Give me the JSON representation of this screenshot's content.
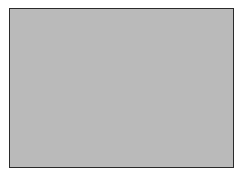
{
  "image": {
    "kind": "noise-texture",
    "description": "Framed rectangular panel filled with fine-grained monochrome random noise (white-noise static)",
    "background_color": "#ffffff",
    "panel": {
      "border_color": "#2a2a2a",
      "border_width_px": 1,
      "left_px": 9,
      "top_px": 8,
      "width_px": 225,
      "height_px": 160
    },
    "noise": {
      "type": "grayscale-uniform",
      "grain_size_px": 1,
      "mean_level": 186,
      "min_level": 132,
      "max_level": 232,
      "mean_color": "#bababa",
      "dark_color": "#848484",
      "light_color": "#e8e8e8",
      "seed": 20240517,
      "monochrome": true,
      "uniform_horizontally": true,
      "uniform_vertically": true
    },
    "text_content": [],
    "controls": []
  }
}
